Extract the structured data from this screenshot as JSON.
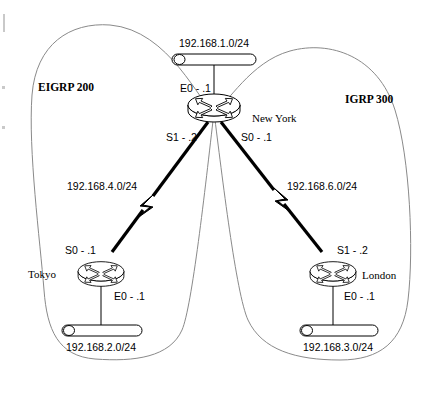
{
  "diagram": {
    "type": "network-topology"
  },
  "autonomous_systems": [
    {
      "id": "eigrp-200",
      "label": "EIGRP 200",
      "x": 38,
      "y": 91
    },
    {
      "id": "igrp-300",
      "label": "IGRP 300",
      "x": 345,
      "y": 103
    }
  ],
  "routers": [
    {
      "id": "newyork",
      "label": "New York",
      "icon": "router-icon",
      "x": 214,
      "y": 108,
      "label_x": 252,
      "label_y": 122
    },
    {
      "id": "tokyo",
      "label": "Tokyo",
      "icon": "router-icon",
      "x": 101,
      "y": 274,
      "label_x": 28,
      "label_y": 278
    },
    {
      "id": "london",
      "label": "London",
      "icon": "router-icon",
      "x": 333,
      "y": 274,
      "label_x": 362,
      "label_y": 279
    }
  ],
  "lan_segments": [
    {
      "id": "lan-192-168-1",
      "label": "192.168.1.0/24",
      "label_x": 214,
      "label_y": 47,
      "bar_x": 172,
      "bar_y": 54,
      "bar_w": 84,
      "bar_h": 11
    },
    {
      "id": "lan-192-168-2",
      "label": "192.168.2.0/24",
      "label_x": 101,
      "label_y": 351,
      "bar_x": 62,
      "bar_y": 325,
      "bar_w": 80,
      "bar_h": 11
    },
    {
      "id": "lan-192-168-3",
      "label": "192.168.3.0/24",
      "label_x": 338,
      "label_y": 351,
      "bar_x": 300,
      "bar_y": 325,
      "bar_w": 78,
      "bar_h": 11
    }
  ],
  "wan_links": [
    {
      "id": "wan-192-168-4",
      "label": "192.168.4.0/24",
      "label_x": 67,
      "label_y": 190,
      "from": "newyork",
      "to": "tokyo"
    },
    {
      "id": "wan-192-168-6",
      "label": "192.168.6.0/24",
      "label_x": 287,
      "label_y": 190,
      "from": "newyork",
      "to": "london"
    }
  ],
  "interface_labels": [
    {
      "id": "ny-e0",
      "text": "E0 - .1",
      "x": 180,
      "y": 92,
      "anchor": "start"
    },
    {
      "id": "ny-s1",
      "text": "S1 - .2",
      "x": 166,
      "y": 141,
      "anchor": "start"
    },
    {
      "id": "ny-s0",
      "text": "S0 - .1",
      "x": 241,
      "y": 141,
      "anchor": "start"
    },
    {
      "id": "tokyo-s0",
      "text": "S0 - .1",
      "x": 65,
      "y": 254,
      "anchor": "start"
    },
    {
      "id": "tokyo-e0",
      "text": "E0 - .1",
      "x": 114,
      "y": 300,
      "anchor": "start"
    },
    {
      "id": "london-s1",
      "text": "S1 - .2",
      "x": 337,
      "y": 254,
      "anchor": "start"
    },
    {
      "id": "london-e0",
      "text": "E0 - .1",
      "x": 344,
      "y": 300,
      "anchor": "start"
    }
  ]
}
